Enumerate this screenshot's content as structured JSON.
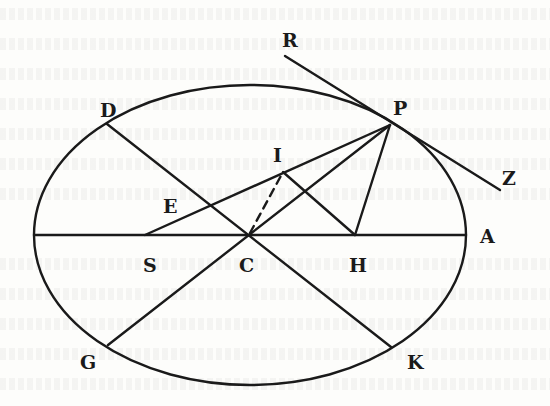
{
  "figure": {
    "stroke_color": "#1a1a1a",
    "background_color": "#fdfdfb"
  },
  "points": {
    "R": "R",
    "P": "P",
    "D": "D",
    "I": "I",
    "E": "E",
    "S": "S",
    "C": "C",
    "H": "H",
    "A": "A",
    "G": "G",
    "K": "K",
    "Z": "Z"
  },
  "segments": [
    {
      "name": "ellipse",
      "from": "",
      "to": ""
    },
    {
      "name": "major-axis",
      "from": "left-vertex",
      "to": "A"
    },
    {
      "name": "tangent",
      "from": "R",
      "to": "Z"
    },
    {
      "name": "diameter",
      "from": "D",
      "to": "K"
    },
    {
      "name": "diameter",
      "from": "G",
      "to": "P"
    },
    {
      "name": "focal-radius",
      "from": "S",
      "to": "P"
    },
    {
      "name": "focal-radius",
      "from": "H",
      "to": "P"
    },
    {
      "name": "parallel",
      "from": "H",
      "to": "I"
    },
    {
      "name": "dashed",
      "from": "C",
      "to": "I"
    }
  ]
}
